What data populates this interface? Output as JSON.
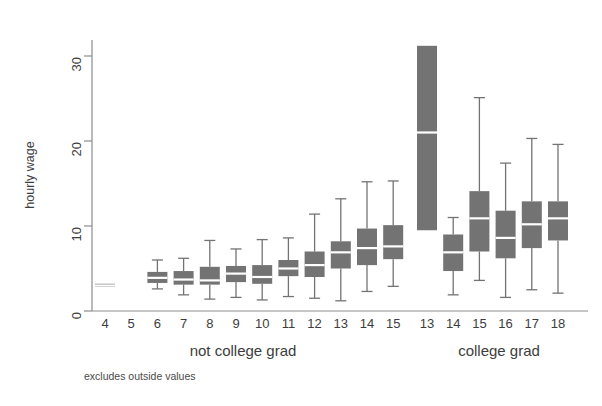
{
  "chart_data": {
    "type": "box",
    "title": "",
    "xlabel": "",
    "ylabel": "hourly wage",
    "ylim": [
      0,
      34
    ],
    "yticks": [
      0,
      10,
      20,
      30
    ],
    "ytick_labels": [
      "0",
      "10",
      "20",
      "30"
    ],
    "grid": false,
    "legend": "none",
    "note": "excludes outside values",
    "groups": [
      {
        "name": "not college grad",
        "label": "not college grad"
      },
      {
        "name": "college grad",
        "label": "college grad"
      }
    ],
    "categories": [
      "4",
      "5",
      "6",
      "7",
      "8",
      "9",
      "10",
      "11",
      "12",
      "13",
      "14",
      "15",
      "13",
      "14",
      "15",
      "16",
      "17",
      "18"
    ],
    "boxes": [
      {
        "x_label": "4",
        "group": "not college grad",
        "whisker_low": 2.9,
        "q1": 2.9,
        "median": 3.0,
        "q3": 3.2,
        "whisker_high": 3.2
      },
      {
        "x_label": "5",
        "group": "not college grad",
        "whisker_low": null,
        "q1": null,
        "median": null,
        "q3": null,
        "whisker_high": null
      },
      {
        "x_label": "6",
        "group": "not college grad",
        "whisker_low": 2.6,
        "q1": 3.3,
        "median": 3.9,
        "q3": 4.6,
        "whisker_high": 6.0
      },
      {
        "x_label": "7",
        "group": "not college grad",
        "whisker_low": 1.9,
        "q1": 3.1,
        "median": 3.7,
        "q3": 4.7,
        "whisker_high": 6.2
      },
      {
        "x_label": "8",
        "group": "not college grad",
        "whisker_low": 1.4,
        "q1": 3.1,
        "median": 3.6,
        "q3": 5.2,
        "whisker_high": 8.3
      },
      {
        "x_label": "9",
        "group": "not college grad",
        "whisker_low": 1.6,
        "q1": 3.4,
        "median": 4.4,
        "q3": 5.3,
        "whisker_high": 7.3
      },
      {
        "x_label": "10",
        "group": "not college grad",
        "whisker_low": 1.3,
        "q1": 3.2,
        "median": 4.0,
        "q3": 5.4,
        "whisker_high": 8.4
      },
      {
        "x_label": "11",
        "group": "not college grad",
        "whisker_low": 1.7,
        "q1": 4.1,
        "median": 5.0,
        "q3": 6.0,
        "whisker_high": 8.6
      },
      {
        "x_label": "12",
        "group": "not college grad",
        "whisker_low": 1.5,
        "q1": 4.0,
        "median": 5.4,
        "q3": 7.0,
        "whisker_high": 11.4
      },
      {
        "x_label": "13",
        "group": "not college grad",
        "whisker_low": 1.2,
        "q1": 5.0,
        "median": 6.9,
        "q3": 8.2,
        "whisker_high": 13.2
      },
      {
        "x_label": "14",
        "group": "not college grad",
        "whisker_low": 2.3,
        "q1": 5.4,
        "median": 7.4,
        "q3": 9.7,
        "whisker_high": 15.2
      },
      {
        "x_label": "15",
        "group": "not college grad",
        "whisker_low": 2.9,
        "q1": 6.1,
        "median": 7.6,
        "q3": 10.1,
        "whisker_high": 15.3
      },
      {
        "x_label": "13",
        "group": "college grad",
        "whisker_low": 9.5,
        "q1": 9.5,
        "median": 21.0,
        "q3": 31.2,
        "whisker_high": 31.2
      },
      {
        "x_label": "14",
        "group": "college grad",
        "whisker_low": 1.9,
        "q1": 4.7,
        "median": 6.9,
        "q3": 9.0,
        "whisker_high": 11.0
      },
      {
        "x_label": "15",
        "group": "college grad",
        "whisker_low": 3.6,
        "q1": 7.0,
        "median": 10.9,
        "q3": 14.1,
        "whisker_high": 25.1
      },
      {
        "x_label": "16",
        "group": "college grad",
        "whisker_low": 1.6,
        "q1": 6.2,
        "median": 8.6,
        "q3": 11.8,
        "whisker_high": 17.4
      },
      {
        "x_label": "17",
        "group": "college grad",
        "whisker_low": 2.5,
        "q1": 7.4,
        "median": 10.2,
        "q3": 12.9,
        "whisker_high": 20.3
      },
      {
        "x_label": "18",
        "group": "college grad",
        "whisker_low": 2.1,
        "q1": 8.3,
        "median": 10.9,
        "q3": 12.9,
        "whisker_high": 19.6
      }
    ]
  },
  "style": {
    "box_fill": "#737373",
    "median_color": "#ffffff",
    "axis_color": "#8c8c8c",
    "text_color": "#3d3d3d",
    "background": "#ffffff"
  }
}
